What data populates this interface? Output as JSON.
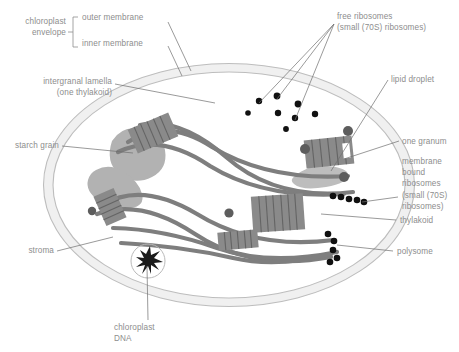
{
  "figure": {
    "background_color": "#ffffff",
    "label_text_color": "#8d8d8d",
    "leader_line_color": "#6f6f6f",
    "envelope_membrane_color": "#b9b9b9",
    "envelope_lumen_color": "#eaeaea",
    "thylakoid_color": "#7e7e7e",
    "granum_color": "#7e7e7e",
    "starch_grain_color": "#b0b0b0",
    "lipid_droplet_color": "#bdbdbd",
    "ribosome_color": "#111111",
    "bound_ribosome_color": "#5d5d5d"
  },
  "labels": {
    "chloroplast_envelope": "chloroplast\nenvelope",
    "outer_membrane": "outer membrane",
    "inner_membrane": "inner membrane",
    "intergranal_lamella": "intergranal lamella\n(one thylakoid)",
    "starch_grain": "starch grain",
    "stroma": "stroma",
    "chloroplast_dna": "chloroplast\nDNA",
    "free_ribosomes": "free ribosomes\n(small (70S) ribosomes)",
    "lipid_droplet": "lipid droplet",
    "one_granum": "one granum",
    "membrane_bound_ribosomes": "membrane\nbound\nribosomes\n(small (70S)\nribosomes)",
    "thylakoid": "thylakoid",
    "polysome": "polysome"
  },
  "structures": {
    "envelope": {
      "name": "chloroplast-envelope",
      "shape": "ellipse",
      "cx": 229,
      "cy": 185,
      "rx": 186,
      "ry": 122,
      "membranes": 2
    },
    "starch_grains": [
      {
        "name": "starch-grain-upper",
        "cx": 134,
        "cy": 152,
        "rx": 26,
        "ry": 21
      },
      {
        "name": "starch-grain-lower",
        "cx": 118,
        "cy": 185,
        "rx": 24,
        "ry": 17
      }
    ],
    "lipid_droplets": [
      {
        "name": "lipid-droplet",
        "cx": 320,
        "cy": 175,
        "rx": 27,
        "ry": 10
      }
    ],
    "grana": [
      {
        "name": "granum-top-left",
        "x": 140,
        "y": 120
      },
      {
        "name": "granum-right",
        "x": 312,
        "y": 142
      },
      {
        "name": "granum-left",
        "x": 103,
        "y": 200
      },
      {
        "name": "granum-center",
        "x": 268,
        "y": 208
      },
      {
        "name": "granum-bottom",
        "x": 228,
        "y": 240
      }
    ],
    "free_ribosome_count": 8,
    "membrane_bound_ribosome_count": 4,
    "polysome_chains": 2,
    "chloroplast_dna": {
      "name": "chloroplast-dna-nucleoid",
      "cx": 148,
      "cy": 261,
      "r": 17
    }
  }
}
